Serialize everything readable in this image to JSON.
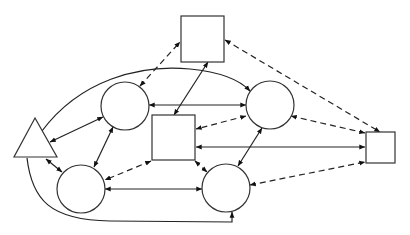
{
  "diagram": {
    "type": "network-graph",
    "background": "#ffffff",
    "stroke_color": "#333333",
    "nodes": [
      {
        "id": "triangle",
        "shape": "triangle",
        "points": [
          [
            35,
            118
          ],
          [
            14,
            157
          ],
          [
            57,
            157
          ]
        ]
      },
      {
        "id": "circle-top-left",
        "shape": "circle",
        "cx": 125,
        "cy": 106,
        "r": 24
      },
      {
        "id": "circle-top-right",
        "shape": "circle",
        "cx": 270,
        "cy": 105,
        "r": 24
      },
      {
        "id": "circle-bottom-left",
        "shape": "circle",
        "cx": 81,
        "cy": 189,
        "r": 24
      },
      {
        "id": "circle-bottom-right",
        "shape": "circle",
        "cx": 226,
        "cy": 188,
        "r": 24
      },
      {
        "id": "rect-top",
        "shape": "rect",
        "x": 181,
        "y": 16,
        "w": 43,
        "h": 46
      },
      {
        "id": "rect-center",
        "shape": "rect",
        "x": 152,
        "y": 115,
        "w": 43,
        "h": 45
      },
      {
        "id": "rect-right",
        "shape": "rect",
        "x": 366,
        "y": 132,
        "w": 29,
        "h": 31
      }
    ],
    "edges": [
      {
        "from": "triangle",
        "to": "circle-top-left",
        "style": "solid",
        "direction": "forward"
      },
      {
        "from": "triangle",
        "to": "circle-top-left",
        "style": "solid",
        "direction": "both"
      },
      {
        "from": "triangle",
        "to": "circle-bottom-left",
        "style": "solid",
        "direction": "both"
      },
      {
        "from": "triangle",
        "to": "circle-top-right",
        "style": "solid-curve",
        "direction": "forward"
      },
      {
        "from": "triangle",
        "to": "circle-bottom-right",
        "style": "solid-curve",
        "direction": "forward"
      },
      {
        "from": "circle-top-left",
        "to": "rect-top",
        "style": "dashed",
        "direction": "both"
      },
      {
        "from": "circle-top-left",
        "to": "circle-top-right",
        "style": "solid",
        "direction": "both"
      },
      {
        "from": "circle-top-left",
        "to": "circle-bottom-left",
        "style": "solid",
        "direction": "both"
      },
      {
        "from": "rect-top",
        "to": "rect-center",
        "style": "solid",
        "direction": "both"
      },
      {
        "from": "rect-top",
        "to": "rect-right",
        "style": "dashed",
        "direction": "both"
      },
      {
        "from": "circle-top-right",
        "to": "rect-center",
        "style": "dashed",
        "direction": "both"
      },
      {
        "from": "circle-top-right",
        "to": "circle-bottom-right",
        "style": "solid",
        "direction": "both"
      },
      {
        "from": "circle-top-right",
        "to": "rect-right",
        "style": "dashed",
        "direction": "both"
      },
      {
        "from": "rect-right",
        "to": "rect-center",
        "style": "solid",
        "direction": "both"
      },
      {
        "from": "rect-center",
        "to": "circle-bottom-left",
        "style": "dashed",
        "direction": "both"
      },
      {
        "from": "rect-center",
        "to": "circle-bottom-right",
        "style": "dashed",
        "direction": "both"
      },
      {
        "from": "circle-bottom-left",
        "to": "circle-bottom-right",
        "style": "solid",
        "direction": "both"
      },
      {
        "from": "circle-bottom-right",
        "to": "rect-right",
        "style": "dashed",
        "direction": "both"
      }
    ]
  }
}
